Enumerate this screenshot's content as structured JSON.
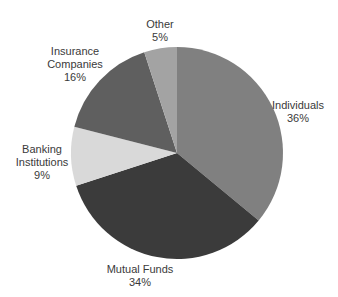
{
  "chart_data": {
    "type": "pie",
    "title": "",
    "start_angle_deg": 0,
    "direction": "clockwise",
    "center": [
      177,
      153
    ],
    "radius": 106,
    "slices": [
      {
        "name": "Individuals",
        "value": 36,
        "label": "36%",
        "color": "#808080",
        "label_lines": [
          "Individuals",
          "36%"
        ],
        "label_pos": [
          298,
          99
        ]
      },
      {
        "name": "Mutual Funds",
        "value": 34,
        "label": "34%",
        "color": "#3b3b3b",
        "label_lines": [
          "Mutual Funds",
          "34%"
        ],
        "label_pos": [
          140,
          263
        ]
      },
      {
        "name": "Banking Institutions",
        "value": 9,
        "label": "9%",
        "color": "#d9d9d9",
        "label_lines": [
          "Banking",
          "Institutions",
          "9%"
        ],
        "label_pos": [
          42,
          143
        ]
      },
      {
        "name": "Insurance Companies",
        "value": 16,
        "label": "16%",
        "color": "#5f5f5f",
        "label_lines": [
          "Insurance",
          "Companies",
          "16%"
        ],
        "label_pos": [
          75,
          45
        ]
      },
      {
        "name": "Other",
        "value": 5,
        "label": "5%",
        "color": "#a3a3a3",
        "label_lines": [
          "Other",
          "5%"
        ],
        "label_pos": [
          160,
          18
        ]
      }
    ],
    "legend": "none (direct labels)"
  },
  "labels": {
    "individuals": {
      "line1": "Individuals",
      "line2": "36%"
    },
    "mutual_funds": {
      "line1": "Mutual Funds",
      "line2": "34%"
    },
    "banking": {
      "line1": "Banking",
      "line2": "Institutions",
      "line3": "9%"
    },
    "insurance": {
      "line1": "Insurance",
      "line2": "Companies",
      "line3": "16%"
    },
    "other": {
      "line1": "Other",
      "line2": "5%"
    }
  }
}
